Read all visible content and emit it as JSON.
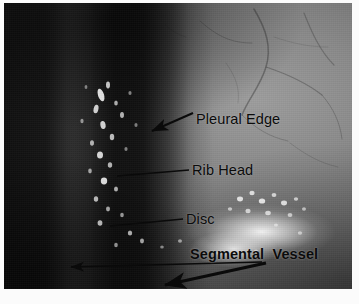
{
  "figure": {
    "kind": "annotated-surgical-photograph",
    "modality": "thoracoscopic intraoperative view",
    "background_color": "#ffffff",
    "annotation_color": "#0b0b0b"
  },
  "annotations": [
    {
      "id": "pleural-edge",
      "label": "Pleural Edge",
      "bold": false,
      "pointer": "arrow",
      "direction": "down-left"
    },
    {
      "id": "rib-head",
      "label": "Rib Head",
      "bold": false,
      "pointer": "leader-line",
      "direction": "left"
    },
    {
      "id": "disc",
      "label": "Disc",
      "bold": false,
      "pointer": "leader-line",
      "direction": "left"
    },
    {
      "id": "segmental-vessel",
      "label": "Segmental  Vessel",
      "bold": true,
      "pointer": "double-arrow",
      "direction": "left and down-left"
    }
  ],
  "image_regions": [
    {
      "id": "dark-left-field",
      "tone": "very dark",
      "hex": "#101010"
    },
    {
      "id": "dissection-band",
      "tone": "dark with bright calcific speckles",
      "hex": "#0a0a0a"
    },
    {
      "id": "grey-tissue-field",
      "tone": "mid grey with fine vessels",
      "hex": "#8a8a8a"
    },
    {
      "id": "specular-highlight",
      "tone": "bright glare",
      "hex": "#ffffff"
    }
  ]
}
